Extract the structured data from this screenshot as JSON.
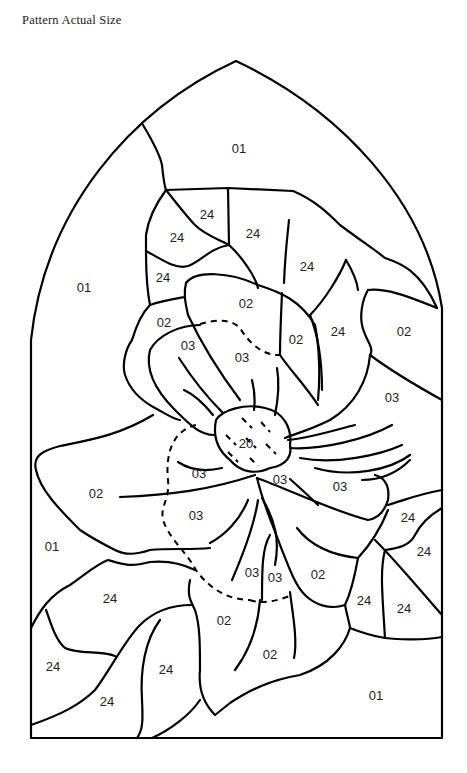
{
  "title": "Pattern Actual Size",
  "pattern": {
    "shape": "gothic-arch window",
    "subject": "flower (poinsettia/dogwood style) stained glass",
    "labels": [
      {
        "text": "01",
        "x": 239,
        "y": 150
      },
      {
        "text": "01",
        "x": 84,
        "y": 289
      },
      {
        "text": "01",
        "x": 52,
        "y": 548
      },
      {
        "text": "01",
        "x": 376,
        "y": 697
      },
      {
        "text": "24",
        "x": 207,
        "y": 216
      },
      {
        "text": "24",
        "x": 177,
        "y": 239
      },
      {
        "text": "24",
        "x": 253,
        "y": 235
      },
      {
        "text": "24",
        "x": 307,
        "y": 268
      },
      {
        "text": "24",
        "x": 163,
        "y": 279
      },
      {
        "text": "24",
        "x": 338,
        "y": 333
      },
      {
        "text": "24",
        "x": 408,
        "y": 519
      },
      {
        "text": "24",
        "x": 424,
        "y": 553
      },
      {
        "text": "24",
        "x": 110,
        "y": 600
      },
      {
        "text": "24",
        "x": 364,
        "y": 602
      },
      {
        "text": "24",
        "x": 404,
        "y": 610
      },
      {
        "text": "24",
        "x": 53,
        "y": 668
      },
      {
        "text": "24",
        "x": 166,
        "y": 671
      },
      {
        "text": "24",
        "x": 107,
        "y": 703
      },
      {
        "text": "02",
        "x": 246,
        "y": 305
      },
      {
        "text": "02",
        "x": 164,
        "y": 324
      },
      {
        "text": "02",
        "x": 296,
        "y": 341
      },
      {
        "text": "02",
        "x": 404,
        "y": 333
      },
      {
        "text": "02",
        "x": 96,
        "y": 495
      },
      {
        "text": "02",
        "x": 318,
        "y": 576
      },
      {
        "text": "02",
        "x": 224,
        "y": 622
      },
      {
        "text": "02",
        "x": 270,
        "y": 656
      },
      {
        "text": "03",
        "x": 188,
        "y": 347
      },
      {
        "text": "03",
        "x": 242,
        "y": 359
      },
      {
        "text": "03",
        "x": 392,
        "y": 399
      },
      {
        "text": "03",
        "x": 199,
        "y": 475
      },
      {
        "text": "03",
        "x": 280,
        "y": 481
      },
      {
        "text": "03",
        "x": 340,
        "y": 488
      },
      {
        "text": "03",
        "x": 196,
        "y": 517
      },
      {
        "text": "03",
        "x": 252,
        "y": 574
      },
      {
        "text": "03",
        "x": 275,
        "y": 579
      },
      {
        "text": "20",
        "x": 246,
        "y": 445
      }
    ]
  }
}
